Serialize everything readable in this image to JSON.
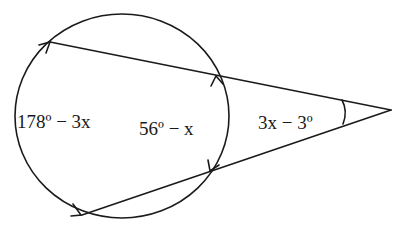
{
  "diagram": {
    "type": "circle-two-secants-external-angle",
    "colors": {
      "stroke": "#1a1a1a",
      "background": "#ffffff"
    },
    "labels": {
      "far_arc": "178º − 3x",
      "near_arc": "56º − x",
      "angle": "3x − 3º"
    },
    "circle": {
      "cx": 122,
      "cy": 116,
      "rx": 107,
      "ry": 102
    },
    "points": {
      "vertex": [
        391,
        110
      ],
      "top_far": [
        50,
        42
      ],
      "top_near": [
        216,
        75
      ],
      "bottom_far": [
        82,
        215
      ],
      "bottom_near": [
        210,
        172
      ]
    }
  }
}
